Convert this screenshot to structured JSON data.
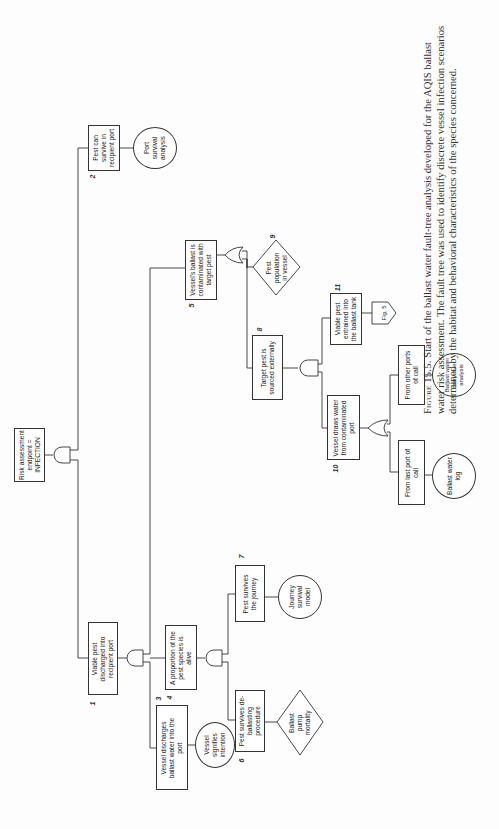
{
  "diagram": {
    "title": "Ballast water fault-tree analysis",
    "orientation": "rotated -90deg (tree root at left, branches grow rightward)",
    "nodes": {
      "root": {
        "label": "Risk assessment endpoint = INFECTION",
        "shape": "rectangle",
        "gate": "AND"
      },
      "n1": {
        "number": "1",
        "label": "Viable pest discharged into recipient port",
        "shape": "rectangle",
        "gate": "AND"
      },
      "n2": {
        "number": "2",
        "label": "Pest can survive in recipient port",
        "shape": "rectangle"
      },
      "n2_leaf": {
        "label": "Port survival analysis",
        "shape": "circle"
      },
      "n3": {
        "number": "3",
        "label": "Vessel discharges ballast water into the port",
        "shape": "rectangle"
      },
      "n3_leaf": {
        "label": "Vessel signifies intention",
        "shape": "circle"
      },
      "n4": {
        "number": "4",
        "label": "A proportion of the pest species is alive",
        "shape": "rectangle",
        "gate": "AND"
      },
      "n5": {
        "number": "5",
        "label": "Vessel's ballast is contaminated with target pest",
        "shape": "rectangle",
        "gate": "OR"
      },
      "n6": {
        "number": "6",
        "label": "Pest survives de-ballasting procedure",
        "shape": "rectangle"
      },
      "n6_leaf": {
        "label": "Ballast pump mortality",
        "shape": "diamond"
      },
      "n7": {
        "number": "7",
        "label": "Pest survives the journey",
        "shape": "rectangle"
      },
      "n7_leaf": {
        "label": "Journey survival model",
        "shape": "circle"
      },
      "n8": {
        "number": "8",
        "label": "Target pest is sourced externally",
        "shape": "rectangle",
        "gate": "AND"
      },
      "n9": {
        "number": "9",
        "label": "Pest population in vessel",
        "shape": "diamond"
      },
      "n10": {
        "number": "10",
        "label": "Vessel draws water from contaminated port",
        "shape": "rectangle",
        "gate": "OR"
      },
      "n11": {
        "number": "11",
        "label": "Viable pest entrained into the ballast tank",
        "shape": "rectangle"
      },
      "n11_leaf": {
        "label": "Fig. 5",
        "shape": "pentagon-transfer"
      },
      "n10a": {
        "label": "From other ports of call",
        "shape": "rectangle"
      },
      "n10a_leaf": {
        "label": "Ballast water carry-over analysis",
        "shape": "circle"
      },
      "n10b": {
        "label": "From last port of call",
        "shape": "rectangle"
      },
      "n10b_leaf": {
        "label": "Ballast water log",
        "shape": "circle"
      }
    },
    "edges": [
      [
        "root",
        "n2"
      ],
      [
        "root",
        "n1"
      ],
      [
        "n2",
        "n2_leaf"
      ],
      [
        "n1",
        "n5"
      ],
      [
        "n1",
        "n4"
      ],
      [
        "n1",
        "n3"
      ],
      [
        "n3",
        "n3_leaf"
      ],
      [
        "n4",
        "n7"
      ],
      [
        "n4",
        "n6"
      ],
      [
        "n7",
        "n7_leaf"
      ],
      [
        "n6",
        "n6_leaf"
      ],
      [
        "n5",
        "n9"
      ],
      [
        "n5",
        "n8"
      ],
      [
        "n8",
        "n11"
      ],
      [
        "n8",
        "n10"
      ],
      [
        "n11",
        "n11_leaf"
      ],
      [
        "n10",
        "n10a"
      ],
      [
        "n10",
        "n10b"
      ],
      [
        "n10a",
        "n10a_leaf"
      ],
      [
        "n10b",
        "n10b_leaf"
      ]
    ]
  },
  "caption": {
    "label": "Figure 15.5.",
    "text": "Start of the ballast water fault-tree analysis developed for the AQIS ballast water risk assessment. The fault tree was used to identify discrete vessel infection scenarios determined by the habitat and behavioral characteristics of the species concerned."
  },
  "colors": {
    "line": "#333333",
    "text": "#222222",
    "background": "#fdfdfd"
  }
}
